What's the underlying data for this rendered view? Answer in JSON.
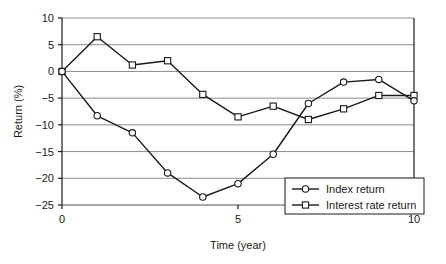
{
  "chart_data": {
    "type": "line",
    "title": "",
    "xlabel": "Time (year)",
    "ylabel": "Return (%)",
    "x": [
      0,
      1,
      2,
      3,
      4,
      5,
      6,
      7,
      8,
      9,
      10
    ],
    "xlim": [
      0,
      10
    ],
    "ylim": [
      -25,
      10
    ],
    "xticks": [
      0,
      5,
      10
    ],
    "xtick_labels": [
      "0",
      "5",
      "10"
    ],
    "yticks": [
      -25,
      -20,
      -15,
      -10,
      -5,
      0,
      5,
      10
    ],
    "ytick_labels": [
      "-25",
      "-20",
      "-15",
      "-10",
      "-5",
      "0",
      "5",
      "10"
    ],
    "grid": "horizontal",
    "legend_position": "bottom-right",
    "series": [
      {
        "name": "Index return",
        "marker": "circle",
        "color": "#1a1a1a",
        "values": [
          0,
          -8.3,
          -11.5,
          -19.0,
          -23.5,
          -21.0,
          -15.5,
          -6.0,
          -2.0,
          -1.5,
          -5.5
        ]
      },
      {
        "name": "Interest rate return",
        "marker": "square",
        "color": "#1a1a1a",
        "values": [
          0,
          6.5,
          1.2,
          2.0,
          -4.3,
          -8.5,
          -6.5,
          -9.0,
          -7.0,
          -4.5,
          -4.5
        ]
      }
    ]
  },
  "legend": {
    "items": [
      {
        "label": "Index return",
        "marker": "circle"
      },
      {
        "label": "Interest rate return",
        "marker": "square"
      }
    ]
  }
}
